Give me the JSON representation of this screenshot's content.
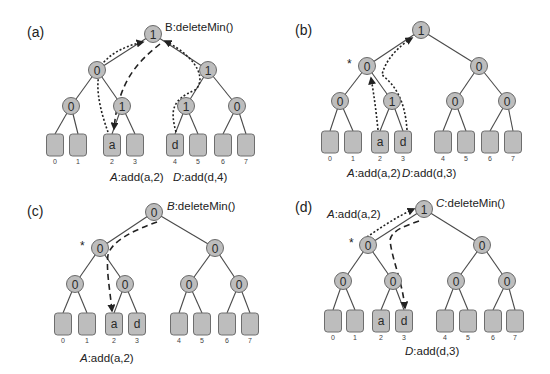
{
  "figure": {
    "panels": [
      {
        "label": "(a)",
        "label_pos": [
          27,
          37
        ],
        "nodes": {
          "root": {
            "value": "1",
            "x": 153,
            "y": 34
          },
          "level1": [
            {
              "value": "0",
              "x": 97,
              "y": 70
            },
            {
              "value": "1",
              "x": 208,
              "y": 70
            }
          ],
          "level2": [
            {
              "value": "0",
              "x": 71,
              "y": 106
            },
            {
              "value": "1",
              "x": 122,
              "y": 106
            },
            {
              "value": "1",
              "x": 186,
              "y": 106
            },
            {
              "value": "0",
              "x": 237,
              "y": 106
            }
          ]
        },
        "leaves": {
          "y": 134,
          "xs": [
            55,
            78,
            112,
            135,
            175,
            198,
            223,
            246
          ],
          "contents": [
            "",
            "",
            "a",
            "",
            "d",
            "",
            "",
            ""
          ],
          "indices": [
            "0",
            "1",
            "2",
            "3",
            "4",
            "5",
            "6",
            "7"
          ]
        },
        "star": null,
        "annotations": [
          {
            "prefix": "B",
            "text": ":deleteMin()",
            "x": 165,
            "y": 31,
            "italic_prefix": false
          },
          {
            "prefix": "A",
            "text": ":add(a,2)",
            "x": 110,
            "y": 181,
            "italic_prefix": true
          },
          {
            "prefix": "D",
            "text": ":add(d,4)",
            "x": 173,
            "y": 181,
            "italic_prefix": true
          }
        ],
        "arrows": [
          {
            "style": "dotted",
            "d": "M108,132 C100,110 92,80 104,62 C115,50 130,45 143,42"
          },
          {
            "style": "dashed",
            "d": "M160,44 C140,60 118,80 114,129"
          },
          {
            "style": "dotted",
            "d": "M176,132 C170,110 172,100 195,90 C205,82 202,60 165,41"
          }
        ]
      },
      {
        "label": "(b)",
        "label_pos": [
          295,
          35
        ],
        "nodes": {
          "root": {
            "value": "1",
            "x": 421,
            "y": 30
          },
          "level1": [
            {
              "value": "0",
              "x": 367,
              "y": 66
            },
            {
              "value": "0",
              "x": 479,
              "y": 66
            }
          ],
          "level2": [
            {
              "value": "0",
              "x": 340,
              "y": 101
            },
            {
              "value": "1",
              "x": 392,
              "y": 101
            },
            {
              "value": "0",
              "x": 455,
              "y": 101
            },
            {
              "value": "0",
              "x": 507,
              "y": 101
            }
          ]
        },
        "leaves": {
          "y": 131,
          "xs": [
            330,
            353,
            380,
            403,
            443,
            466,
            490,
            513
          ],
          "contents": [
            "",
            "",
            "a",
            "d",
            "",
            "",
            "",
            ""
          ],
          "indices": [
            "0",
            "1",
            "2",
            "3",
            "4",
            "5",
            "6",
            "7"
          ]
        },
        "star": {
          "x": 347,
          "y": 68
        },
        "annotations": [
          {
            "prefix": "A",
            "text": ":add(a,2)",
            "x": 347,
            "y": 177,
            "italic_prefix": true
          },
          {
            "prefix": "D",
            "text": ":add(d,3)",
            "x": 402,
            "y": 177,
            "italic_prefix": true
          }
        ],
        "arrows": [
          {
            "style": "dotted",
            "d": "M378,130 C376,110 374,95 371,78"
          },
          {
            "style": "dotted",
            "d": "M407,130 C405,100 395,85 382,75 C385,60 400,45 412,38"
          }
        ]
      },
      {
        "label": "(c)",
        "label_pos": [
          27,
          216
        ],
        "nodes": {
          "root": {
            "value": "0",
            "x": 154,
            "y": 212
          },
          "level1": [
            {
              "value": "0",
              "x": 100,
              "y": 248
            },
            {
              "value": "0",
              "x": 215,
              "y": 248
            }
          ],
          "level2": [
            {
              "value": "0",
              "x": 75,
              "y": 284
            },
            {
              "value": "0",
              "x": 125,
              "y": 284
            },
            {
              "value": "0",
              "x": 189,
              "y": 284
            },
            {
              "value": "0",
              "x": 239,
              "y": 284
            }
          ]
        },
        "leaves": {
          "y": 313,
          "xs": [
            63,
            87,
            114,
            137,
            179,
            202,
            227,
            250
          ],
          "contents": [
            "",
            "",
            "a",
            "d",
            "",
            "",
            "",
            ""
          ],
          "indices": [
            "0",
            "1",
            "2",
            "3",
            "4",
            "5",
            "6",
            "7"
          ]
        },
        "star": {
          "x": 80,
          "y": 250
        },
        "annotations": [
          {
            "prefix": "B",
            "text": ":deleteMin()",
            "x": 167,
            "y": 210,
            "italic_prefix": true
          },
          {
            "prefix": "A",
            "text": ":add(a,2)",
            "x": 80,
            "y": 362,
            "italic_prefix": true
          }
        ],
        "arrows": [
          {
            "style": "dashed",
            "d": "M157,222 C135,230 112,240 108,255 C106,270 110,290 112,311"
          }
        ]
      },
      {
        "label": "(d)",
        "label_pos": [
          295,
          212
        ],
        "nodes": {
          "root": {
            "value": "1",
            "x": 424,
            "y": 209
          },
          "level1": [
            {
              "value": "0",
              "x": 368,
              "y": 245
            },
            {
              "value": "0",
              "x": 482,
              "y": 245
            }
          ],
          "level2": [
            {
              "value": "0",
              "x": 343,
              "y": 281
            },
            {
              "value": "0",
              "x": 393,
              "y": 281
            },
            {
              "value": "0",
              "x": 456,
              "y": 281
            },
            {
              "value": "0",
              "x": 507,
              "y": 281
            }
          ]
        },
        "leaves": {
          "y": 310,
          "xs": [
            333,
            355,
            381,
            404,
            445,
            468,
            493,
            515
          ],
          "contents": [
            "",
            "",
            "a",
            "d",
            "",
            "",
            "",
            ""
          ],
          "indices": [
            "0",
            "1",
            "2",
            "3",
            "4",
            "5",
            "6",
            "7"
          ]
        },
        "star": {
          "x": 349,
          "y": 247
        },
        "annotations": [
          {
            "prefix": "C",
            "text": ":deleteMin()",
            "x": 436,
            "y": 207,
            "italic_prefix": true
          },
          {
            "prefix": "A",
            "text": ":add(a,2)",
            "x": 327,
            "y": 218,
            "italic_prefix": true
          },
          {
            "prefix": "D",
            "text": ":add(d,3)",
            "x": 405,
            "y": 355,
            "italic_prefix": true
          }
        ],
        "arrows": [
          {
            "style": "dotted",
            "d": "M367,237 C380,228 398,216 414,209"
          },
          {
            "style": "dashed",
            "d": "M419,221 C405,226 392,230 390,240 C392,260 402,280 405,308"
          }
        ]
      }
    ]
  }
}
